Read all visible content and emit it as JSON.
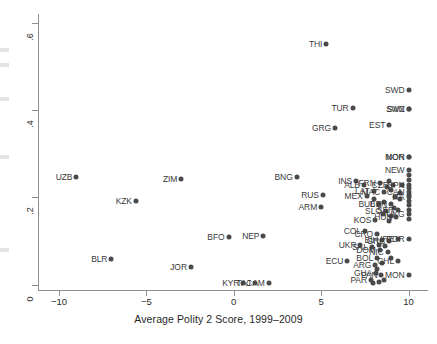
{
  "chart_data": {
    "type": "scatter",
    "title": "",
    "xlabel": "Average Polity 2 Score, 1999–2009",
    "ylabel": "",
    "xlim": [
      -11.2,
      11.0
    ],
    "ylim": [
      -0.012,
      0.62
    ],
    "xticks": [
      -10,
      -5,
      0,
      5,
      10
    ],
    "xtick_labels": [
      "−10",
      "−5",
      "0",
      "5",
      "10"
    ],
    "yticks": [
      0,
      0.2,
      0.4,
      0.6
    ],
    "ytick_labels": [
      "0",
      ".2",
      ".4",
      ".6"
    ],
    "grid": false,
    "legend": null,
    "marker": {
      "shape": "circle",
      "color": "#4a4a4a",
      "size": 5
    },
    "points": [
      {
        "label": "UZB",
        "x": -9.0,
        "y": 0.246,
        "pos": "r"
      },
      {
        "label": "KZK",
        "x": -5.6,
        "y": 0.192,
        "pos": "r"
      },
      {
        "label": "BLR",
        "x": -7.0,
        "y": 0.058,
        "pos": "r"
      },
      {
        "label": "ZIM",
        "x": -3.0,
        "y": 0.243,
        "pos": "r"
      },
      {
        "label": "JOR",
        "x": -2.45,
        "y": 0.04,
        "pos": "r"
      },
      {
        "label": "BFO",
        "x": -0.3,
        "y": 0.11,
        "pos": "r"
      },
      {
        "label": "NEP",
        "x": 1.7,
        "y": 0.112,
        "pos": "r"
      },
      {
        "label": "KYR",
        "x": 0.55,
        "y": 0.003,
        "pos": "r"
      },
      {
        "label": "CAM",
        "x": 2.0,
        "y": 0.003,
        "pos": "r"
      },
      {
        "label": "TAJ",
        "x": 1.2,
        "y": 0.003,
        "pos": "r"
      },
      {
        "label": "BNG",
        "x": 3.6,
        "y": 0.247,
        "pos": "r"
      },
      {
        "label": "THI",
        "x": 5.3,
        "y": 0.552,
        "pos": "r"
      },
      {
        "label": "RUS",
        "x": 5.1,
        "y": 0.205,
        "pos": "r"
      },
      {
        "label": "ARM",
        "x": 5.0,
        "y": 0.178,
        "pos": "r"
      },
      {
        "label": "GRG",
        "x": 5.8,
        "y": 0.36,
        "pos": "r"
      },
      {
        "label": "TUR",
        "x": 6.8,
        "y": 0.405,
        "pos": "r"
      },
      {
        "label": "EST",
        "x": 8.9,
        "y": 0.365,
        "pos": "r"
      },
      {
        "label": "SWD",
        "x": 10.0,
        "y": 0.447,
        "pos": "r"
      },
      {
        "label": "SWZ",
        "x": 10.0,
        "y": 0.402,
        "pos": "r"
      },
      {
        "label": "SVN",
        "x": 10.0,
        "y": 0.402,
        "pos": "r"
      },
      {
        "label": "NOR",
        "x": 10.0,
        "y": 0.292,
        "pos": "r"
      },
      {
        "label": "MON",
        "x": 10.0,
        "y": 0.292,
        "pos": "r"
      },
      {
        "label": "INS",
        "x": 7.0,
        "y": 0.238,
        "pos": "r"
      },
      {
        "label": "NEW",
        "x": 10.0,
        "y": 0.262,
        "pos": "r"
      },
      {
        "label": "ALB",
        "x": 7.45,
        "y": 0.228,
        "pos": "r"
      },
      {
        "label": "FRN",
        "x": 8.35,
        "y": 0.232,
        "pos": "r"
      },
      {
        "label": "CZR",
        "x": 9.1,
        "y": 0.228,
        "pos": "r"
      },
      {
        "label": "SPN",
        "x": 10.0,
        "y": 0.228,
        "pos": "r"
      },
      {
        "label": "LAT",
        "x": 8.0,
        "y": 0.214,
        "pos": "r"
      },
      {
        "label": "MAC",
        "x": 8.6,
        "y": 0.212,
        "pos": "r"
      },
      {
        "label": "CAN",
        "x": 10.0,
        "y": 0.212,
        "pos": "r"
      },
      {
        "label": "MEX",
        "x": 7.6,
        "y": 0.204,
        "pos": "r"
      },
      {
        "label": "ITA",
        "x": 10.0,
        "y": 0.2,
        "pos": "r"
      },
      {
        "label": "BUL",
        "x": 8.3,
        "y": 0.186,
        "pos": "r"
      },
      {
        "label": "BEN",
        "x": 9.0,
        "y": 0.186,
        "pos": "r"
      },
      {
        "label": "SLO",
        "x": 8.7,
        "y": 0.168,
        "pos": "r"
      },
      {
        "label": "SER",
        "x": 9.4,
        "y": 0.172,
        "pos": "r"
      },
      {
        "label": "HUN",
        "x": 9.3,
        "y": 0.156,
        "pos": "r"
      },
      {
        "label": "UKG",
        "x": 10.0,
        "y": 0.162,
        "pos": "r"
      },
      {
        "label": "KOS",
        "x": 8.1,
        "y": 0.148,
        "pos": "r"
      },
      {
        "label": "COL",
        "x": 7.5,
        "y": 0.122,
        "pos": "r"
      },
      {
        "label": "CRO",
        "x": 8.2,
        "y": 0.116,
        "pos": "r"
      },
      {
        "label": "BIH",
        "x": 8.5,
        "y": 0.103,
        "pos": "r"
      },
      {
        "label": "GRC",
        "x": 8.9,
        "y": 0.1,
        "pos": "r"
      },
      {
        "label": "IRE",
        "x": 9.4,
        "y": 0.104,
        "pos": "r"
      },
      {
        "label": "POR",
        "x": 10.0,
        "y": 0.104,
        "pos": "r"
      },
      {
        "label": "UKR",
        "x": 7.25,
        "y": 0.09,
        "pos": "r"
      },
      {
        "label": "SAL",
        "x": 7.9,
        "y": 0.086,
        "pos": "r"
      },
      {
        "label": "DOM",
        "x": 8.35,
        "y": 0.08,
        "pos": "r"
      },
      {
        "label": "NIC",
        "x": 8.8,
        "y": 0.074,
        "pos": "r"
      },
      {
        "label": "BOL",
        "x": 8.2,
        "y": 0.062,
        "pos": "r"
      },
      {
        "label": "CHL",
        "x": 9.4,
        "y": 0.055,
        "pos": "r"
      },
      {
        "label": "ECU",
        "x": 6.5,
        "y": 0.055,
        "pos": "r"
      },
      {
        "label": "ARG",
        "x": 8.1,
        "y": 0.045,
        "pos": "r"
      },
      {
        "label": "GUA",
        "x": 8.15,
        "y": 0.028,
        "pos": "r"
      },
      {
        "label": "PAN",
        "x": 8.45,
        "y": 0.022,
        "pos": "r"
      },
      {
        "label": "PAR",
        "x": 7.85,
        "y": 0.012,
        "pos": "r"
      },
      {
        "label": "MON",
        "x": 10.0,
        "y": 0.022,
        "pos": "r"
      }
    ],
    "extra_points": [
      {
        "x": 10.0,
        "y": 0.252
      },
      {
        "x": 10.0,
        "y": 0.24
      },
      {
        "x": 10.0,
        "y": 0.222
      },
      {
        "x": 10.0,
        "y": 0.206
      },
      {
        "x": 10.0,
        "y": 0.192
      },
      {
        "x": 10.0,
        "y": 0.182
      },
      {
        "x": 10.0,
        "y": 0.172
      },
      {
        "x": 10.0,
        "y": 0.15
      },
      {
        "x": 9.6,
        "y": 0.228
      },
      {
        "x": 9.5,
        "y": 0.21
      },
      {
        "x": 9.5,
        "y": 0.196
      },
      {
        "x": 9.2,
        "y": 0.2
      },
      {
        "x": 9.0,
        "y": 0.216
      },
      {
        "x": 8.75,
        "y": 0.224
      },
      {
        "x": 8.9,
        "y": 0.238
      },
      {
        "x": 9.15,
        "y": 0.176
      },
      {
        "x": 8.6,
        "y": 0.19
      },
      {
        "x": 8.05,
        "y": 0.196
      },
      {
        "x": 8.55,
        "y": 0.162
      },
      {
        "x": 9.0,
        "y": 0.158
      },
      {
        "x": 8.9,
        "y": 0.146
      },
      {
        "x": 8.3,
        "y": 0.092
      },
      {
        "x": 8.65,
        "y": 0.088
      },
      {
        "x": 9.0,
        "y": 0.062
      },
      {
        "x": 8.5,
        "y": 0.05
      },
      {
        "x": 8.2,
        "y": 0.036
      },
      {
        "x": 8.3,
        "y": 0.006
      },
      {
        "x": 8.6,
        "y": 0.01
      },
      {
        "x": 7.95,
        "y": 0.004
      }
    ]
  }
}
